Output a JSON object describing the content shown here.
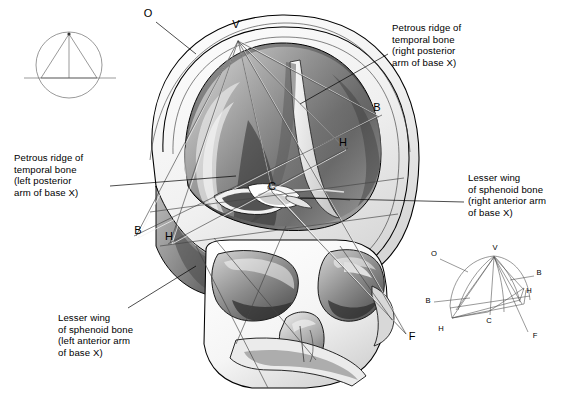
{
  "figure": {
    "type": "anatomical-illustration"
  },
  "captions": [
    {
      "id": "petrous-right",
      "text": "Petrous ridge of\ntemporal bone\n(right posterior\narm of base X)",
      "x": 392,
      "y": 22
    },
    {
      "id": "petrous-left",
      "text": "Petrous ridge of\ntemporal bone\n(left posterior\narm of base X)",
      "x": 14,
      "y": 152
    },
    {
      "id": "lesser-wing-right",
      "text": "Lesser wing\nof sphenoid bone\n(right anterior arm\nof base X)",
      "x": 468,
      "y": 172
    },
    {
      "id": "lesser-wing-left",
      "text": "Lesser wing\nof sphenoid bone\n(left anterior arm\nof base X)",
      "x": 58,
      "y": 312
    }
  ],
  "markers": [
    {
      "label": "O",
      "x": 148,
      "y": 17
    },
    {
      "label": "V",
      "x": 236,
      "y": 28
    },
    {
      "label": "B",
      "x": 377,
      "y": 111
    },
    {
      "label": "H",
      "x": 343,
      "y": 146
    },
    {
      "label": "C",
      "x": 272,
      "y": 190
    },
    {
      "label": "B",
      "x": 138,
      "y": 234
    },
    {
      "label": "H",
      "x": 169,
      "y": 240
    },
    {
      "label": "F",
      "x": 412,
      "y": 340
    }
  ],
  "key_diagram": {
    "caption": "base X schematic",
    "markers": [
      {
        "label": "O",
        "x": 434,
        "y": 256
      },
      {
        "label": "V",
        "x": 495,
        "y": 250
      },
      {
        "label": "B",
        "x": 537,
        "y": 275
      },
      {
        "label": "H",
        "x": 527,
        "y": 292
      },
      {
        "label": "B",
        "x": 428,
        "y": 301
      },
      {
        "label": "C",
        "x": 489,
        "y": 313
      },
      {
        "label": "H",
        "x": 441,
        "y": 323
      },
      {
        "label": "F",
        "x": 534,
        "y": 337
      }
    ]
  },
  "circle_diagram": {
    "caption": "circle with inscribed triangle",
    "cx": 69,
    "cy": 65,
    "r": 33
  },
  "colors": {
    "ink": "#000000",
    "leader": "#000000",
    "construction": "#444444",
    "bone_light": "#f4f4f4",
    "cavity_dark": "#3a3a3a",
    "cavity_mid": "#9a9a9a"
  }
}
